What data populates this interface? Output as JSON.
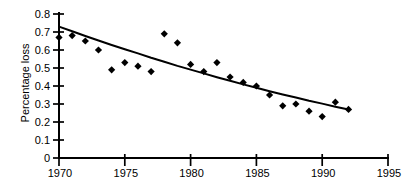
{
  "chart_data": {
    "type": "scatter",
    "title": "",
    "xlabel": "",
    "ylabel": "Percentage loss",
    "xlim": [
      1970,
      1995
    ],
    "ylim": [
      0,
      0.8
    ],
    "grid": false,
    "legend": false,
    "background_color": "#ffffff",
    "ink_color": "#000000",
    "marker": "diamond",
    "x_tick_labels": [
      "1970",
      "1975",
      "1980",
      "1985",
      "1990",
      "1995"
    ],
    "y_tick_labels": [
      "0",
      "0.1",
      "0.2",
      "0.3",
      "0.4",
      "0.5",
      "0.6",
      "0.7",
      "0.8"
    ],
    "series": [
      {
        "name": "observed-percentage-loss",
        "style": "points",
        "x": [
          1970,
          1971,
          1972,
          1973,
          1974,
          1975,
          1976,
          1977,
          1978,
          1979,
          1980,
          1981,
          1982,
          1983,
          1984,
          1985,
          1986,
          1987,
          1988,
          1989,
          1990,
          1991,
          1992
        ],
        "y": [
          0.67,
          0.68,
          0.65,
          0.6,
          0.49,
          0.53,
          0.51,
          0.48,
          0.69,
          0.64,
          0.52,
          0.48,
          0.53,
          0.45,
          0.42,
          0.4,
          0.35,
          0.29,
          0.3,
          0.26,
          0.23,
          0.31,
          0.27
        ]
      },
      {
        "name": "fitted-trend-curve",
        "style": "line",
        "x": [
          1970,
          1971,
          1972,
          1973,
          1974,
          1975,
          1976,
          1977,
          1978,
          1979,
          1980,
          1981,
          1982,
          1983,
          1984,
          1985,
          1986,
          1987,
          1988,
          1989,
          1990,
          1991,
          1992
        ],
        "y": [
          0.73,
          0.704,
          0.678,
          0.653,
          0.628,
          0.604,
          0.581,
          0.557,
          0.535,
          0.512,
          0.491,
          0.47,
          0.449,
          0.429,
          0.409,
          0.39,
          0.371,
          0.353,
          0.336,
          0.318,
          0.302,
          0.285,
          0.269
        ]
      }
    ]
  }
}
